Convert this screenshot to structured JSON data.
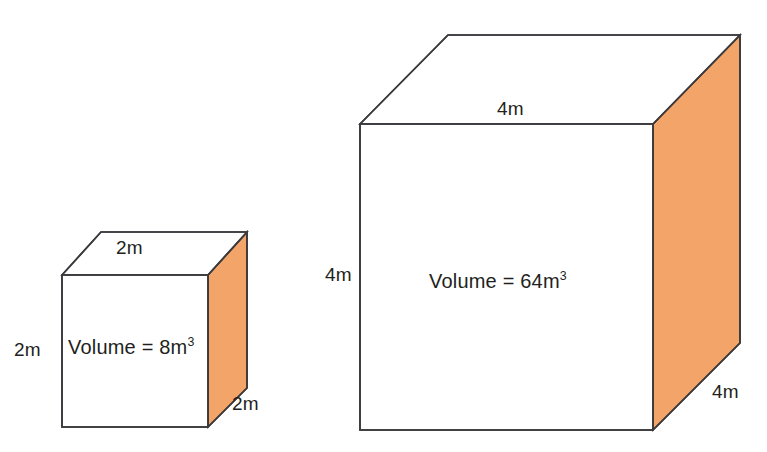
{
  "figure": {
    "name": "cube-volume-comparison",
    "background_color": "#ffffff",
    "stroke_color": "#3b3b3f",
    "orange_face_color": "#f2a469",
    "text_color": "#231f20",
    "unit": "m",
    "volume_word": "Volume",
    "equals_sign": "="
  },
  "small_cube": {
    "edge_length": "2m",
    "top_label": "2m",
    "left_label": "2m",
    "depth_label": "2m",
    "volume_text": "Volume = 8m",
    "volume_exponent": "3",
    "volume_value": 8,
    "volume_unit": "m",
    "side": 2
  },
  "large_cube": {
    "edge_length": "4m",
    "top_label": "4m",
    "left_label": "4m",
    "depth_label": "4m",
    "volume_text": "Volume = 64m",
    "volume_exponent": "3",
    "volume_value": 64,
    "volume_unit": "m",
    "side": 4
  }
}
